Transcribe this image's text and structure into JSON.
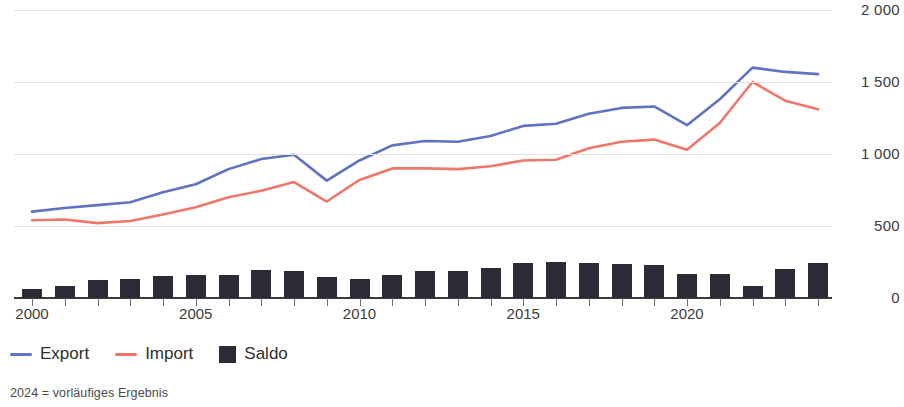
{
  "chart_data": {
    "type": "line",
    "title": "",
    "subtitle": "",
    "xlabel": "",
    "ylabel": "",
    "ylim": [
      0,
      2000
    ],
    "y_ticks": [
      0,
      500,
      1000,
      1500,
      2000
    ],
    "y_tick_labels": [
      "0",
      "500",
      "1 000",
      "1 500",
      "2 000"
    ],
    "grid": true,
    "legend_position": "bottom-left",
    "x": [
      2000,
      2001,
      2002,
      2003,
      2004,
      2005,
      2006,
      2007,
      2008,
      2009,
      2010,
      2011,
      2012,
      2013,
      2014,
      2015,
      2016,
      2017,
      2018,
      2019,
      2020,
      2021,
      2022,
      2023,
      2024
    ],
    "x_tick_labels": [
      "2000",
      "2005",
      "2010",
      "2015",
      "2020"
    ],
    "x_ticks": [
      2000,
      2005,
      2010,
      2015,
      2020
    ],
    "series": [
      {
        "name": "Export",
        "type": "line",
        "color": "#6072c0",
        "values": [
          600,
          625,
          645,
          665,
          735,
          790,
          895,
          965,
          995,
          815,
          955,
          1060,
          1090,
          1085,
          1125,
          1195,
          1210,
          1280,
          1320,
          1330,
          1200,
          1380,
          1600,
          1570,
          1555
        ]
      },
      {
        "name": "Import",
        "type": "line",
        "color": "#ef7769",
        "values": [
          540,
          545,
          520,
          535,
          580,
          630,
          700,
          745,
          805,
          670,
          820,
          900,
          900,
          895,
          915,
          955,
          960,
          1040,
          1085,
          1100,
          1030,
          1215,
          1500,
          1370,
          1310
        ]
      },
      {
        "name": "Saldo",
        "type": "bar",
        "color": "#2b2b38",
        "values": [
          60,
          80,
          125,
          130,
          155,
          160,
          160,
          195,
          190,
          145,
          135,
          160,
          190,
          190,
          210,
          240,
          250,
          240,
          235,
          230,
          170,
          165,
          85,
          200,
          245
        ]
      }
    ],
    "legend": [
      {
        "label": "Export",
        "marker": "line",
        "color": "#6072c0"
      },
      {
        "label": "Import",
        "marker": "line",
        "color": "#ef7769"
      },
      {
        "label": "Saldo",
        "marker": "square",
        "color": "#2b2b38"
      }
    ],
    "footnote": "2024 = vorläufiges Ergebnis"
  }
}
